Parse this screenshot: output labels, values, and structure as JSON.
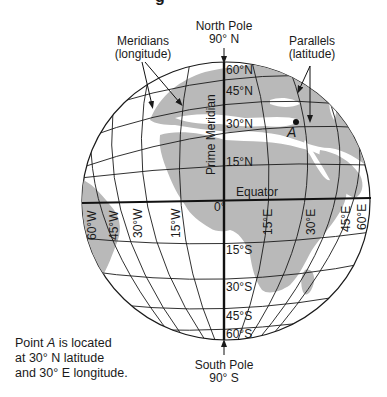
{
  "title_fragment": "g",
  "poles": {
    "north": {
      "name": "North Pole",
      "value": "90° N"
    },
    "south": {
      "name": "South Pole",
      "value": "90° S"
    }
  },
  "callouts": {
    "meridians": {
      "line1": "Meridians",
      "line2": "(longitude)"
    },
    "parallels": {
      "line1": "Parallels",
      "line2": "(latitude)"
    }
  },
  "prime_meridian_label": "Prime Meridian",
  "equator_label": "Equator",
  "origin_label": "0°",
  "latitude_labels": {
    "n60": "60°N",
    "n45": "45°N",
    "n30": "30°N",
    "n15": "15°N",
    "s15": "15°S",
    "s30": "30°S",
    "s45": "45°S",
    "s60": "60°S"
  },
  "longitude_labels": {
    "w60": "60°W",
    "w45": "45°W",
    "w30": "30°W",
    "w15": "15°W",
    "e15": "15°E",
    "e30": "30°E",
    "e45": "45°E",
    "e60": "60°E"
  },
  "point": {
    "name": "A",
    "latitude": "30° N",
    "longitude": "30° E"
  },
  "caption": {
    "line1_pre": "Point ",
    "line1_point": "A",
    "line1_post": " is located",
    "line2": "at 30° N latitude",
    "line3": "and 30° E longitude."
  },
  "colors": {
    "land": "#b9b9b9",
    "ocean": "#ffffff",
    "grid": "#1a1a1a"
  }
}
